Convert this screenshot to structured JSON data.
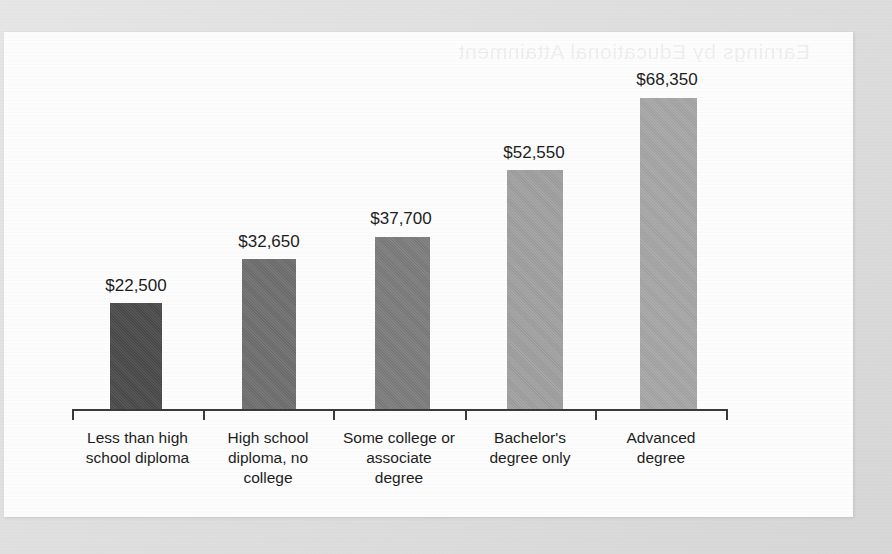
{
  "figure": {
    "paper_background": "#fdfdfd",
    "scan_background": "#e2e2e2",
    "bleed_through_text": "Earnings by Educational Attainment"
  },
  "chart_data": {
    "type": "bar",
    "title": "",
    "subtitle": "",
    "xlabel": "",
    "ylabel": "",
    "categories": [
      "Less than high school diploma",
      "High school diploma, no college",
      "Some college or associate degree",
      "Bachelor's degree only",
      "Advanced degree"
    ],
    "values": [
      22500,
      32650,
      37700,
      52550,
      68350
    ],
    "value_labels": [
      "$22,500",
      "$32,650",
      "$37,700",
      "$52,550",
      "$68,350"
    ],
    "bar_colors": [
      "#4a4a4a",
      "#6e6e6e",
      "#7c7c7c",
      "#a0a0a0",
      "#a6a6a6"
    ],
    "ylim": [
      0,
      75000
    ],
    "grid": false,
    "legend": null,
    "axis_visible": {
      "x": true,
      "y": false
    },
    "value_prefix": "$",
    "bars": [
      {
        "category_lines": [
          "Less than high",
          "school diploma"
        ],
        "label": "$22,500",
        "value": 22500,
        "color": "#4a4a4a",
        "x": 110,
        "y": 303,
        "w": 52,
        "h": 106,
        "label_x": 88,
        "label_y": 276,
        "tick_x": 72,
        "cell_x": 72,
        "cell_w": 131
      },
      {
        "category_lines": [
          "High school",
          "diploma, no",
          "college"
        ],
        "label": "$32,650",
        "value": 32650,
        "color": "#6e6e6e",
        "x": 242,
        "y": 259,
        "w": 54,
        "h": 150,
        "label_x": 221,
        "label_y": 232,
        "tick_x": 203,
        "cell_x": 203,
        "cell_w": 130
      },
      {
        "category_lines": [
          "Some college or",
          "associate",
          "degree"
        ],
        "label": "$37,700",
        "value": 37700,
        "color": "#7c7c7c",
        "x": 375,
        "y": 237,
        "w": 55,
        "h": 172,
        "label_x": 353,
        "label_y": 209,
        "tick_x": 333,
        "cell_x": 333,
        "cell_w": 132
      },
      {
        "category_lines": [
          "Bachelor's",
          "degree only"
        ],
        "label": "$52,550",
        "value": 52550,
        "color": "#a0a0a0",
        "x": 507,
        "y": 170,
        "w": 56,
        "h": 239,
        "label_x": 486,
        "label_y": 143,
        "tick_x": 465,
        "cell_x": 465,
        "cell_w": 130
      },
      {
        "category_lines": [
          "Advanced",
          "degree"
        ],
        "label": "$68,350",
        "value": 68350,
        "color": "#a6a6a6",
        "x": 640,
        "y": 98,
        "w": 57,
        "h": 311,
        "label_x": 619,
        "label_y": 70,
        "tick_x": 595,
        "cell_x": 595,
        "cell_w": 132
      }
    ],
    "axis": {
      "x_start": 72,
      "x_end": 728,
      "y": 409,
      "end_tick_x": 726
    }
  }
}
